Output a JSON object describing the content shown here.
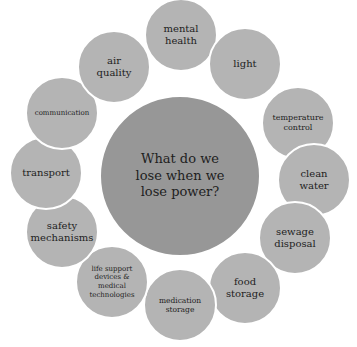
{
  "diagram": {
    "center": {
      "label": "What do we\nlose when we\nlose power?",
      "color": "#979797"
    },
    "satellite_color": "#b4b4b4",
    "items": [
      {
        "label": "mental\nhealth"
      },
      {
        "label": "light"
      },
      {
        "label": "temperature\ncontrol"
      },
      {
        "label": "clean\nwater"
      },
      {
        "label": "sewage\ndisposal"
      },
      {
        "label": "food\nstorage"
      },
      {
        "label": "medication\nstorage"
      },
      {
        "label": "life support\ndevices &\nmedical\ntechnologies"
      },
      {
        "label": "safety\nmechanisms"
      },
      {
        "label": "transport"
      },
      {
        "label": "communication"
      },
      {
        "label": "air\nquality"
      }
    ]
  }
}
